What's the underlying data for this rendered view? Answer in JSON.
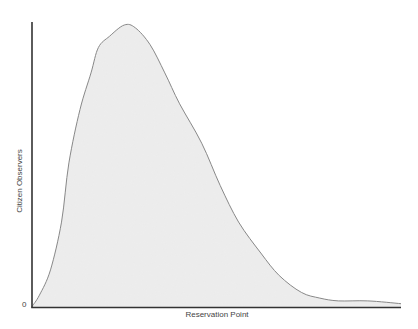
{
  "chart_data": {
    "type": "area",
    "title": "",
    "xlabel": "Reservation Point",
    "ylabel": "Citizen Observers",
    "y_tick_labels": [
      "0"
    ],
    "x_tick_labels": [],
    "grid": false,
    "legend": null,
    "x": [
      0,
      0.02,
      0.05,
      0.08,
      0.1,
      0.13,
      0.16,
      0.18,
      0.21,
      0.25,
      0.28,
      0.32,
      0.36,
      0.4,
      0.46,
      0.51,
      0.56,
      0.62,
      0.67,
      0.73,
      0.78,
      0.83,
      0.91,
      1.0
    ],
    "y": [
      0.0,
      0.04,
      0.13,
      0.3,
      0.51,
      0.7,
      0.83,
      0.92,
      0.96,
      1.0,
      0.99,
      0.93,
      0.83,
      0.72,
      0.58,
      0.43,
      0.3,
      0.19,
      0.11,
      0.05,
      0.03,
      0.02,
      0.02,
      0.01
    ],
    "peak": {
      "x": 0.25,
      "y": 1.0
    },
    "fill_color": "#ebebeb",
    "line_color": "#888888",
    "axis_color": "#333333"
  },
  "labels": {
    "x_axis": "Reservation Point",
    "y_axis": "Citizen Observers",
    "y_zero": "0"
  }
}
